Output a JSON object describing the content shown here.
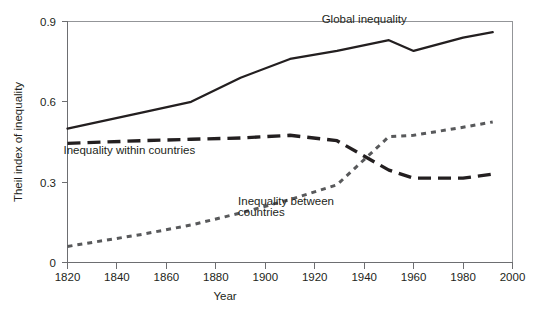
{
  "chart_data": {
    "type": "line",
    "title": "",
    "xlabel": "Year",
    "ylabel": "Theil index of inequality",
    "xlim": [
      1820,
      2000
    ],
    "ylim": [
      0,
      0.9
    ],
    "grid": false,
    "legend_position": "inline-annotations",
    "x_ticks": [
      1820,
      1840,
      1860,
      1880,
      1900,
      1920,
      1940,
      1960,
      1980,
      2000
    ],
    "y_ticks": [
      0,
      0.3,
      0.6,
      0.9
    ],
    "x_tick_labels": [
      "1820",
      "1840",
      "1860",
      "1880",
      "1900",
      "1920",
      "1940",
      "1960",
      "1980",
      "2000"
    ],
    "y_tick_labels": [
      "0",
      "0.3",
      "0.6",
      "0.9"
    ],
    "series": [
      {
        "name": "Global inequality",
        "style": "solid",
        "label_x": 1940,
        "label_y": 0.895,
        "x": [
          1820,
          1850,
          1870,
          1890,
          1910,
          1929,
          1950,
          1960,
          1980,
          1992
        ],
        "values": [
          0.5,
          0.56,
          0.6,
          0.69,
          0.76,
          0.79,
          0.83,
          0.79,
          0.84,
          0.86
        ]
      },
      {
        "name": "Inequality within countries",
        "style": "dashed",
        "label_x": 1845,
        "label_y": 0.405,
        "x": [
          1820,
          1850,
          1870,
          1890,
          1910,
          1929,
          1950,
          1960,
          1980,
          1992
        ],
        "values": [
          0.445,
          0.455,
          0.46,
          0.465,
          0.475,
          0.455,
          0.345,
          0.315,
          0.315,
          0.33
        ]
      },
      {
        "name": "Inequality between countries",
        "style": "dotted",
        "label_x": 1889,
        "label_y": 0.215,
        "x": [
          1820,
          1850,
          1870,
          1890,
          1910,
          1929,
          1950,
          1960,
          1980,
          1992
        ],
        "values": [
          0.06,
          0.105,
          0.14,
          0.185,
          0.235,
          0.29,
          0.47,
          0.475,
          0.505,
          0.525
        ]
      }
    ],
    "annotations": [
      {
        "text": "Global inequality",
        "x": 1940,
        "y": 0.895
      },
      {
        "text": "Inequality within countries",
        "x": 1845,
        "y": 0.405
      },
      {
        "text": "Inequality between",
        "x": 1889,
        "y": 0.215
      },
      {
        "text": "countries",
        "x": 1889,
        "y": 0.175
      }
    ],
    "colors": {
      "global": "#231f20",
      "within": "#231f20",
      "between": "#58595b",
      "axis": "#6d6e71",
      "frame": "#939598",
      "background": "#ffffff"
    }
  }
}
